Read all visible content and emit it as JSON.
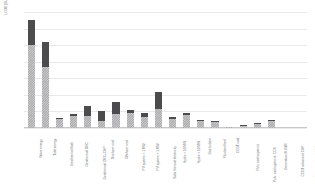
{
  "chart_data": {
    "type": "bar",
    "stacked": true,
    "title": "",
    "xlabel": "",
    "ylabel": "LCOE [EUR/MWh]",
    "ylim": [
      0,
      70
    ],
    "ytick_step": 10,
    "yticks": [
      "0",
      "10",
      "20",
      "30",
      "40",
      "50",
      "60",
      "70"
    ],
    "grid": true,
    "legend_position": "none",
    "categories": [
      "Wave energy",
      "Tidal energy",
      "Geothermal flash",
      "Geothermal ORC",
      "Geothermal ORC+CHP",
      "Onshore wind",
      "Offshore wind",
      "PV system < 1 MW",
      "PV system > 1 MW",
      "Solar thermal electricity",
      "Hydro < 10 MW",
      "Hydro > 10 MW",
      "Gas turbine",
      "Fluidised bed",
      "CCGT coal",
      "Pulv. coal supercrit.",
      "Pulv. coal supercrit. CCS",
      "Generation III LWR",
      "CCGT advanced CHP",
      "Supercritical coal CHP"
    ],
    "series": [
      {
        "name": "Lower range",
        "pattern": "hatched",
        "color": "#a8a8aa",
        "values": [
          50.0,
          37.0,
          5.5,
          7.0,
          7.0,
          4.0,
          8.5,
          9.0,
          6.5,
          11.5,
          5.5,
          8.0,
          4.0,
          3.5,
          0.6,
          1.4,
          2.6,
          4.0,
          0.0,
          0.0
        ]
      },
      {
        "name": "Upper range",
        "pattern": "solid",
        "color": "#4c4c4e",
        "values": [
          15.0,
          15.0,
          0.8,
          1.4,
          6.5,
          6.0,
          7.5,
          1.6,
          2.8,
          10.5,
          1.0,
          1.2,
          0.6,
          0.6,
          0.2,
          0.4,
          0.4,
          0.8,
          0.0,
          0.0
        ]
      }
    ],
    "totals": [
      65.0,
      52.0,
      6.3,
      8.4,
      13.5,
      10.0,
      16.0,
      10.6,
      9.3,
      22.0,
      6.5,
      9.2,
      4.6,
      4.1,
      0.8,
      1.8,
      3.0,
      4.8,
      0.0,
      0.0
    ]
  }
}
